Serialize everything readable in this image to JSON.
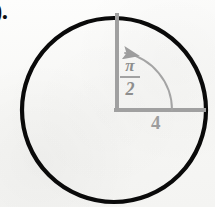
{
  "figure": {
    "item_number": ").",
    "background_color": "#fbfbfa",
    "circle": {
      "name": "circle",
      "center_x": 114,
      "center_y": 110,
      "radius": 92,
      "stroke_color": "#0a0a0a",
      "stroke_width": 4.2,
      "fill": "none"
    },
    "vertical_radius": {
      "name": "vertical-radius",
      "from_x": 117,
      "from_y": 110,
      "to_x": 117,
      "to_y": 13,
      "stroke_color": "#a0a0a0",
      "stroke_width": 4
    },
    "horizontal_radius": {
      "name": "horizontal-radius",
      "from_x": 114,
      "from_y": 110,
      "to_x": 205,
      "to_y": 110,
      "stroke_color": "#a0a0a0",
      "stroke_width": 4
    },
    "angle_arc": {
      "name": "angle-arc",
      "start_x": 172,
      "start_y": 110,
      "end_x": 124,
      "end_y": 52,
      "sweep_direction": "counterclockwise",
      "arrow_at": "end",
      "stroke_color": "#a4a4a4",
      "stroke_width": 1.8
    },
    "labels": {
      "angle_numerator": "π",
      "angle_denominator": "2",
      "angle_text": "π/2",
      "radius_length": "4",
      "label_color": "#9a9a9a"
    }
  }
}
